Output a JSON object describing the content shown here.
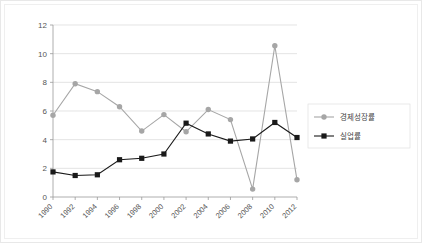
{
  "chart_data": {
    "type": "line",
    "title": "",
    "xlabel": "",
    "ylabel": "",
    "categories": [
      "1990",
      "1992",
      "1994",
      "1996",
      "1998",
      "2000",
      "2002",
      "2004",
      "2006",
      "2008",
      "2010",
      "2012"
    ],
    "ylim": [
      0,
      12
    ],
    "yticks": [
      "0",
      "2",
      "4",
      "6",
      "8",
      "10",
      "12"
    ],
    "grid": true,
    "legend_position": "right",
    "series": [
      {
        "name": "경제성장률",
        "color": "#a6a6a6",
        "marker": "circle",
        "values": [
          5.7,
          7.9,
          7.35,
          6.3,
          4.6,
          5.75,
          4.55,
          6.1,
          5.4,
          0.55,
          10.55,
          1.2
        ]
      },
      {
        "name": "실업률",
        "color": "#1a1a1a",
        "marker": "square",
        "values": [
          1.75,
          1.5,
          1.55,
          2.6,
          2.7,
          3.0,
          5.15,
          4.4,
          3.9,
          4.05,
          5.2,
          4.15
        ]
      }
    ]
  },
  "legend": {
    "items": [
      {
        "label": "경제성장률"
      },
      {
        "label": "실업률"
      }
    ]
  }
}
